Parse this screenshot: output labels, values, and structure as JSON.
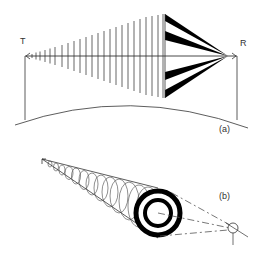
{
  "figure": {
    "panel_a": {
      "label": "(a)",
      "left_end_label": "T",
      "right_end_label": "R",
      "colors": {
        "line": "#333333",
        "fill": "#000000",
        "hatch": "#555555"
      }
    },
    "panel_b": {
      "label": "(b)",
      "colors": {
        "line": "#333333",
        "ring": "#000000",
        "dash": "#555555"
      }
    }
  }
}
